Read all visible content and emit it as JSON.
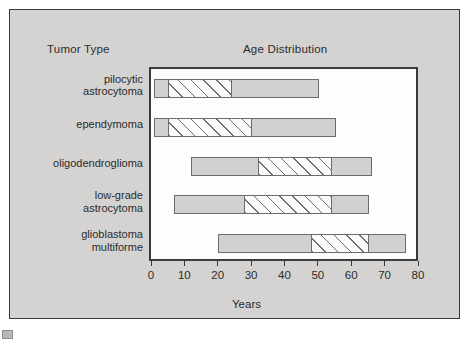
{
  "figure": {
    "column_headers": {
      "category_header": "Tumor Type",
      "chart_header": "Age Distribution"
    },
    "xaxis_title": "Years"
  },
  "chart_data": {
    "type": "bar",
    "orientation": "horizontal",
    "subtype": "range-bar",
    "title": "Age Distribution",
    "xlabel": "Years",
    "ylabel": "Tumor Type",
    "xlim": [
      0,
      80
    ],
    "xticks": [
      0,
      10,
      20,
      30,
      40,
      50,
      60,
      70,
      80
    ],
    "xtick_labels": [
      "0",
      "10",
      "20",
      "30",
      "40",
      "50",
      "60",
      "70",
      "80"
    ],
    "grid": false,
    "legend": null,
    "series_note": "Each bar spans the total age range; the hatched sub-segment marks the peak-incidence age range.",
    "categories": [
      "pilocytic astrocytoma",
      "ependymoma",
      "oligodendroglioma",
      "low-grade astrocytoma",
      "glioblastoma multiforme"
    ],
    "bars": [
      {
        "label": "pilocytic astrocytoma",
        "label_lines": [
          "pilocytic",
          "astrocytoma"
        ],
        "range_start": 1,
        "range_end": 50,
        "peak_start": 5,
        "peak_end": 24
      },
      {
        "label": "ependymoma",
        "label_lines": [
          "ependymoma"
        ],
        "range_start": 1,
        "range_end": 55,
        "peak_start": 5,
        "peak_end": 30
      },
      {
        "label": "oligodendroglioma",
        "label_lines": [
          "oligodendroglioma"
        ],
        "range_start": 12,
        "range_end": 66,
        "peak_start": 32,
        "peak_end": 54
      },
      {
        "label": "low-grade astrocytoma",
        "label_lines": [
          "low-grade",
          "astrocytoma"
        ],
        "range_start": 7,
        "range_end": 65,
        "peak_start": 28,
        "peak_end": 54
      },
      {
        "label": "glioblastoma multiforme",
        "label_lines": [
          "glioblastoma",
          "multiforme"
        ],
        "range_start": 20,
        "range_end": 76,
        "peak_start": 48,
        "peak_end": 65
      }
    ]
  },
  "colors": {
    "panel_background": "#d4d3d1",
    "plot_background": "#fdfdfd",
    "bar_fill": "#d2d1cf",
    "bar_border": "#6b6b6b",
    "hatch_stroke": "#6f6f6f",
    "text": "#2b2b2b",
    "axis": "#3a3a3a"
  }
}
